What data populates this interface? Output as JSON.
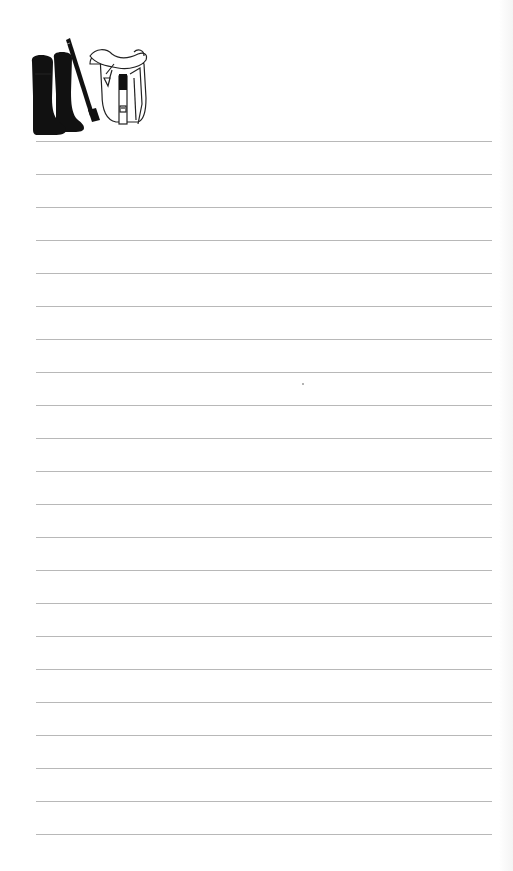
{
  "page": {
    "type": "lined-notepad",
    "background": "#ffffff",
    "line_color": "#b8b8b8"
  },
  "header_art": {
    "icons": [
      "riding-boots-icon",
      "riding-crop-icon",
      "saddle-icon"
    ],
    "alt": "Equestrian riding boots, crop and saddle"
  },
  "ruled_lines": {
    "count": 22,
    "first_y": 141,
    "spacing": 33,
    "left": 36,
    "right": 492
  }
}
